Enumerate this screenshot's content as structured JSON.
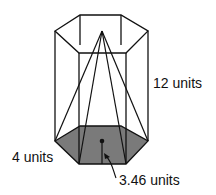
{
  "diagram": {
    "type": "hexagonal prism containing hexagonal pyramid",
    "labels": {
      "height": "12 units",
      "side": "4 units",
      "apothem": "3.46 units"
    },
    "colors": {
      "base_fill": "#7a7a7a",
      "stroke": "#111111",
      "background": "#ffffff"
    }
  }
}
